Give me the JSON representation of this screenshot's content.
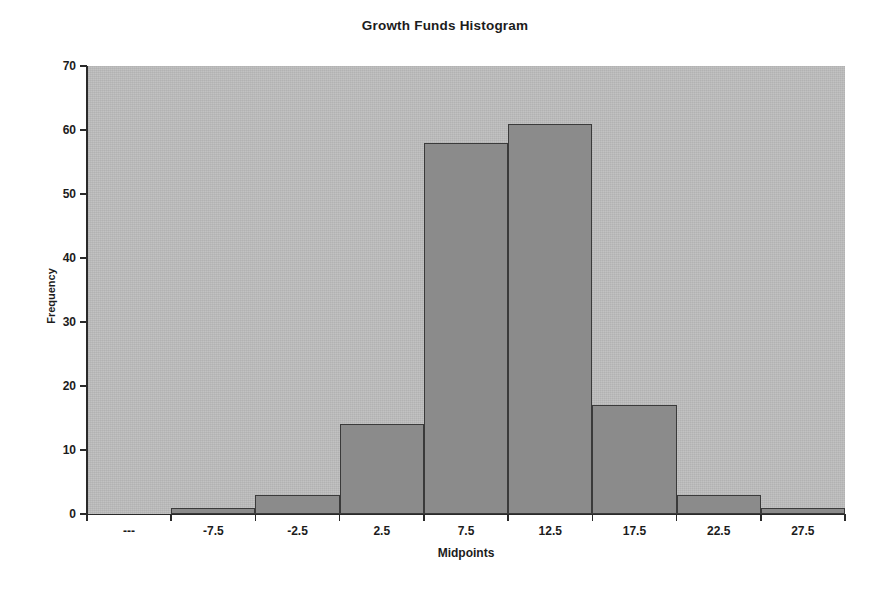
{
  "chart_data": {
    "type": "bar",
    "title": "Growth Funds Histogram",
    "xlabel": "Midpoints",
    "ylabel": "Frequency",
    "categories": [
      "---",
      "-7.5",
      "-2.5",
      "2.5",
      "7.5",
      "12.5",
      "17.5",
      "22.5",
      "27.5"
    ],
    "values": [
      0,
      1,
      3,
      14,
      58,
      61,
      17,
      3,
      1
    ],
    "ylim": [
      0,
      70
    ],
    "ytick_labels": [
      "0",
      "10",
      "20",
      "30",
      "40",
      "50",
      "60",
      "70"
    ],
    "ytick_values": [
      0,
      10,
      20,
      30,
      40,
      50,
      60,
      70
    ],
    "grid": false,
    "legend": "none",
    "plot_background": "#bdbdbd",
    "bar_fill": "#8b8b8b",
    "bar_border": "#3a3a3a",
    "axis_color": "#2a2a2a",
    "page_background": "#ffffff"
  }
}
